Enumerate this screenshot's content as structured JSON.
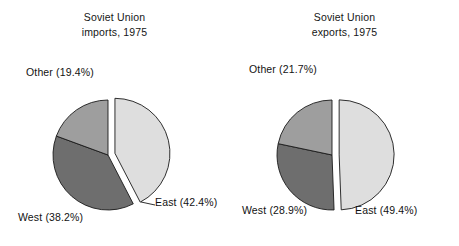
{
  "figure": {
    "background_color": "#ffffff",
    "text_color": "#121212"
  },
  "palette": {
    "east_fill": "#dedede",
    "west_fill": "#6e6e6e",
    "other_fill": "#9e9e9e",
    "edge": "#1a1a1a"
  },
  "charts": {
    "imports": {
      "title_line1": "Soviet Union",
      "title_line2": "imports, 1975",
      "labels": {
        "other": "Other (19.4%)",
        "west": "West (38.2%)",
        "east": "East (42.4%)"
      }
    },
    "exports": {
      "title_line1": "Soviet Union",
      "title_line2": "exports, 1975",
      "labels": {
        "other": "Other (21.7%)",
        "west": "West (28.9%)",
        "east": "East (49.4%)"
      }
    }
  },
  "chart_data": [
    {
      "type": "pie",
      "title": "Soviet Union imports, 1975",
      "categories": [
        "East",
        "West",
        "Other"
      ],
      "values": [
        42.4,
        38.2,
        19.4
      ],
      "value_unit": "percent",
      "labels": [
        "East (42.4%)",
        "West (38.2%)",
        "Other (19.4%)"
      ],
      "colors": [
        "#dedede",
        "#6e6e6e",
        "#9e9e9e"
      ],
      "exploded": [
        "East"
      ],
      "explode_offset": 0.13,
      "start_angle_deg": 90,
      "direction": "clockwise",
      "legend": "none",
      "labels_position": "outside"
    },
    {
      "type": "pie",
      "title": "Soviet Union exports, 1975",
      "categories": [
        "East",
        "West",
        "Other"
      ],
      "values": [
        49.4,
        28.9,
        21.7
      ],
      "value_unit": "percent",
      "labels": [
        "East (49.4%)",
        "West (28.9%)",
        "Other (21.7%)"
      ],
      "colors": [
        "#dedede",
        "#6e6e6e",
        "#9e9e9e"
      ],
      "exploded": [
        "East"
      ],
      "explode_offset": 0.13,
      "start_angle_deg": 90,
      "direction": "clockwise",
      "legend": "none",
      "labels_position": "outside"
    }
  ]
}
